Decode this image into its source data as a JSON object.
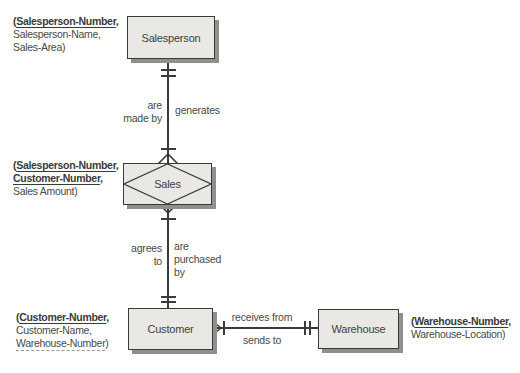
{
  "colors": {
    "background": "#ffffff",
    "box_fill": "#e9e8e4",
    "box_border": "#3a3a38",
    "box_shadow": "#908f8d",
    "line": "#3a3a38",
    "text": "#4a4a48"
  },
  "entities": {
    "salesperson": {
      "label": "Salesperson",
      "type": "entity"
    },
    "sales": {
      "label": "Sales",
      "type": "associative-entity"
    },
    "customer": {
      "label": "Customer",
      "type": "entity"
    },
    "warehouse": {
      "label": "Warehouse",
      "type": "entity"
    }
  },
  "attributes": {
    "salesperson": {
      "open": "(",
      "key1": "Salesperson-Number",
      "key1_sep": ",",
      "line2": "Salesperson-Name,",
      "line3": "Sales-Area)"
    },
    "sales": {
      "open": "(",
      "key1": "Salesperson-Number",
      "key1_sep": ",",
      "key2": "Customer-Number",
      "key2_sep": ",",
      "line3": "Sales Amount)"
    },
    "customer": {
      "open": "(",
      "key1": "Customer-Number",
      "key1_sep": ",",
      "line2": "Customer-Name,",
      "foreign_key": "Warehouse-Number",
      "close": ")"
    },
    "warehouse": {
      "open": "(",
      "key1": "Warehouse-Number",
      "key1_sep": ",",
      "line2": "Warehouse-Location)"
    }
  },
  "relationships": {
    "salesperson_sales": {
      "left_label_line1": "are",
      "left_label_line2": "made by",
      "right_label": "generates",
      "salesperson_end": "one-and-only-one",
      "sales_end": "one-or-many"
    },
    "customer_sales": {
      "left_label_line1": "agrees",
      "left_label_line2": "to",
      "right_label_line1": "are",
      "right_label_line2": "purchased",
      "right_label_line3": "by",
      "customer_end": "one-and-only-one",
      "sales_end": "one-or-many"
    },
    "warehouse_customer": {
      "top_label": "receives from",
      "bottom_label": "sends to",
      "customer_end": "one-or-many",
      "warehouse_end": "one-and-only-one"
    }
  }
}
